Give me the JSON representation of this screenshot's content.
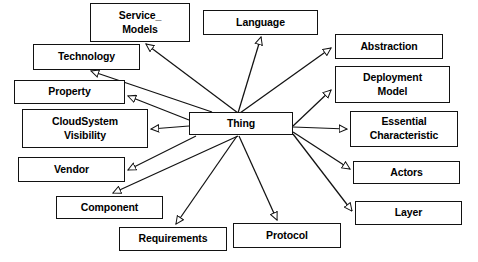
{
  "diagram": {
    "type": "uml-class-diagram",
    "relationship": "generalization",
    "line_color": "#121212",
    "node_fill": "#ffffff",
    "node_border": "#121212",
    "background": "#ffffff",
    "root": {
      "id": "thing",
      "label": "Thing"
    },
    "nodes": [
      {
        "id": "service-models",
        "label": "Service_\nModels",
        "x": 90,
        "y": 3,
        "w": 100,
        "h": 39
      },
      {
        "id": "language",
        "label": "Language",
        "x": 203,
        "y": 10,
        "w": 115,
        "h": 25
      },
      {
        "id": "abstraction",
        "label": "Abstraction",
        "x": 335,
        "y": 34,
        "w": 108,
        "h": 25
      },
      {
        "id": "technology",
        "label": "Technology",
        "x": 33,
        "y": 44,
        "w": 107,
        "h": 26
      },
      {
        "id": "deployment-model",
        "label": "Deployment\nModel",
        "x": 335,
        "y": 66,
        "w": 115,
        "h": 37
      },
      {
        "id": "property",
        "label": "Property",
        "x": 14,
        "y": 80,
        "w": 111,
        "h": 24
      },
      {
        "id": "cloudsystem-visibility",
        "label": "CloudSystem\nVisibility",
        "x": 22,
        "y": 109,
        "w": 126,
        "h": 39
      },
      {
        "id": "thing",
        "label": "Thing",
        "x": 189,
        "y": 112,
        "w": 104,
        "h": 23
      },
      {
        "id": "essential-characteristic",
        "label": "Essential\nCharacteristic",
        "x": 350,
        "y": 111,
        "w": 108,
        "h": 36
      },
      {
        "id": "vendor",
        "label": "Vendor",
        "x": 18,
        "y": 157,
        "w": 107,
        "h": 25
      },
      {
        "id": "actors",
        "label": "Actors",
        "x": 353,
        "y": 161,
        "w": 107,
        "h": 23
      },
      {
        "id": "component",
        "label": "Component",
        "x": 56,
        "y": 196,
        "w": 107,
        "h": 23
      },
      {
        "id": "layer",
        "label": "Layer",
        "x": 355,
        "y": 201,
        "w": 107,
        "h": 24
      },
      {
        "id": "protocol",
        "label": "Protocol",
        "x": 233,
        "y": 223,
        "w": 108,
        "h": 25
      },
      {
        "id": "requirements",
        "label": "Requirements",
        "x": 119,
        "y": 227,
        "w": 108,
        "h": 24
      }
    ],
    "edges": [
      {
        "id": "thing-to-service-models",
        "from": "thing",
        "to": "service-models",
        "x1": 238,
        "y1": 113,
        "x2": 146,
        "y2": 44
      },
      {
        "id": "thing-to-language",
        "from": "thing",
        "to": "language",
        "x1": 238,
        "y1": 113,
        "x2": 261,
        "y2": 37
      },
      {
        "id": "thing-to-abstraction",
        "from": "thing",
        "to": "abstraction",
        "x1": 240,
        "y1": 113,
        "x2": 331,
        "y2": 48
      },
      {
        "id": "thing-to-technology",
        "from": "thing",
        "to": "technology",
        "x1": 212,
        "y1": 112,
        "x2": 91,
        "y2": 71
      },
      {
        "id": "thing-to-deployment-model",
        "from": "thing",
        "to": "deployment-model",
        "x1": 293,
        "y1": 126,
        "x2": 331,
        "y2": 90
      },
      {
        "id": "thing-to-property",
        "from": "thing",
        "to": "property",
        "x1": 189,
        "y1": 120,
        "x2": 128,
        "y2": 96
      },
      {
        "id": "thing-to-cloudsystem-visibility",
        "from": "thing",
        "to": "cloudsystem-visibility",
        "x1": 189,
        "y1": 126,
        "x2": 151,
        "y2": 129
      },
      {
        "id": "thing-to-essential-characteristic",
        "from": "thing",
        "to": "essential-characteristic",
        "x1": 293,
        "y1": 127,
        "x2": 347,
        "y2": 129
      },
      {
        "id": "thing-to-vendor",
        "from": "thing",
        "to": "vendor",
        "x1": 196,
        "y1": 136,
        "x2": 128,
        "y2": 170
      },
      {
        "id": "thing-to-actors",
        "from": "thing",
        "to": "actors",
        "x1": 293,
        "y1": 132,
        "x2": 350,
        "y2": 169
      },
      {
        "id": "thing-to-component",
        "from": "thing",
        "to": "component",
        "x1": 238,
        "y1": 136,
        "x2": 113,
        "y2": 193
      },
      {
        "id": "thing-to-layer",
        "from": "thing",
        "to": "layer",
        "x1": 293,
        "y1": 134,
        "x2": 352,
        "y2": 211
      },
      {
        "id": "thing-to-protocol",
        "from": "thing",
        "to": "protocol",
        "x1": 239,
        "y1": 136,
        "x2": 277,
        "y2": 220
      },
      {
        "id": "thing-to-requirements",
        "from": "thing",
        "to": "requirements",
        "x1": 237,
        "y1": 136,
        "x2": 176,
        "y2": 224
      }
    ]
  }
}
